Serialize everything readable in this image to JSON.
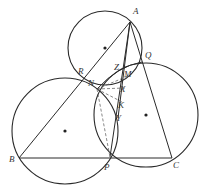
{
  "figure": {
    "type": "geometry-diagram",
    "points": {
      "A": {
        "label": "A",
        "x": 130,
        "y": 22,
        "lx": 133,
        "ly": 14
      },
      "B": {
        "label": "B",
        "x": 19,
        "y": 158,
        "lx": 9,
        "ly": 162
      },
      "C": {
        "label": "C",
        "x": 172,
        "y": 158,
        "lx": 173,
        "ly": 168
      },
      "P": {
        "label": "P",
        "x": 110,
        "y": 157,
        "lx": 104,
        "ly": 170
      },
      "Q": {
        "label": "Q",
        "x": 142,
        "y": 62,
        "lx": 145,
        "ly": 58
      },
      "R": {
        "label": "R",
        "x": 81,
        "y": 80,
        "lx": 78,
        "ly": 74
      },
      "N": {
        "label": "N",
        "x": 97,
        "y": 89,
        "lx": 88,
        "ly": 86
      },
      "Z": {
        "label": "Z",
        "x": 123,
        "y": 71,
        "lx": 114,
        "ly": 70
      },
      "M": {
        "label": "M",
        "x": 128,
        "y": 76,
        "lx": 124,
        "ly": 77
      },
      "X": {
        "label": "X",
        "x": 125,
        "y": 88,
        "lx": 120,
        "ly": 92
      },
      "K": {
        "label": "K",
        "x": 122,
        "y": 102,
        "lx": 118,
        "ly": 108
      },
      "Y": {
        "label": "Y",
        "x": 118,
        "y": 118,
        "lx": 116,
        "ly": 121
      }
    },
    "circles": [
      {
        "name": "circle-ARNQ",
        "cx": 105,
        "cy": 48,
        "r": 37,
        "center_dot": true
      },
      {
        "name": "circle-BNP",
        "cx": 65,
        "cy": 131,
        "r": 53,
        "center_dot": true
      },
      {
        "name": "circle-NQCP",
        "cx": 146,
        "cy": 115,
        "r": 52,
        "center_dot": true
      }
    ],
    "segments": [
      {
        "from": "A",
        "to": "B",
        "style": "solid"
      },
      {
        "from": "B",
        "to": "C",
        "style": "solid"
      },
      {
        "from": "A",
        "to": "C",
        "style": "solid"
      },
      {
        "from": "A",
        "to": "P",
        "style": "solid"
      },
      {
        "from": "N",
        "to": "M",
        "style": "dashed"
      },
      {
        "from": "N",
        "to": "X",
        "style": "dashed"
      },
      {
        "from": "N",
        "to": "K",
        "style": "dashed"
      },
      {
        "from": "N",
        "to": "P",
        "style": "dashed"
      }
    ],
    "labels": [
      "A",
      "B",
      "C",
      "P",
      "Q",
      "R",
      "N",
      "Z",
      "M",
      "X",
      "K",
      "Y"
    ]
  }
}
